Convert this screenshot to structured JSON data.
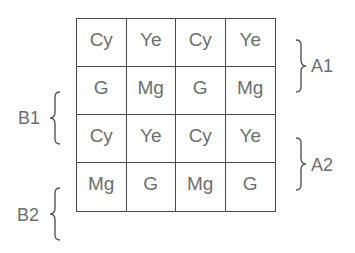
{
  "grid": {
    "rows": [
      [
        "Cy",
        "Ye",
        "Cy",
        "Ye"
      ],
      [
        "G",
        "Mg",
        "G",
        "Mg"
      ],
      [
        "Cy",
        "Ye",
        "Cy",
        "Ye"
      ],
      [
        "Mg",
        "G",
        "Mg",
        "G"
      ]
    ]
  },
  "labels": {
    "a1": "A1",
    "a2": "A2",
    "b1": "B1",
    "b2": "B2"
  }
}
